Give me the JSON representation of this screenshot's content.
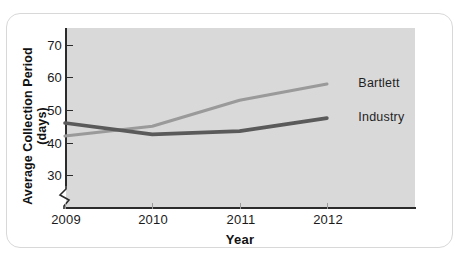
{
  "chart_data": {
    "type": "line",
    "title": "",
    "subtitle": "",
    "xlabel": "Year",
    "ylabel": "Average Collection Period (days)",
    "x": [
      2009,
      2010,
      2011,
      2012
    ],
    "categories": [
      "2009",
      "2010",
      "2011",
      "2012"
    ],
    "xtick_labels": [
      "2009",
      "2010",
      "2011",
      "2012"
    ],
    "ytick_labels": [
      "30",
      "40",
      "50",
      "60",
      "70"
    ],
    "ytick_values": [
      30,
      40,
      50,
      60,
      70
    ],
    "ylim": [
      26,
      73
    ],
    "xlim": [
      2009,
      2012.9
    ],
    "y_axis_broken": true,
    "grid": false,
    "legend_position": "inline-right",
    "plot_background": "#d9d9d9",
    "series": [
      {
        "name": "Bartlett",
        "label": "Bartlett",
        "color": "#9a9a9a",
        "values": [
          42,
          45,
          53,
          58
        ]
      },
      {
        "name": "Industry",
        "label": "Industry",
        "color": "#5a5a5a",
        "values": [
          46,
          42.5,
          43.5,
          47.5
        ]
      }
    ],
    "annotations": [
      {
        "text": "Bartlett",
        "x": 2012.2,
        "y": 58
      },
      {
        "text": "Industry",
        "x": 2012.2,
        "y": 47.5
      }
    ]
  },
  "axis": {
    "y_title": "Average Collection Period (days)",
    "x_title": "Year",
    "y_ticks": [
      {
        "label": "70",
        "value": 70
      },
      {
        "label": "60",
        "value": 60
      },
      {
        "label": "50",
        "value": 50
      },
      {
        "label": "40",
        "value": 40
      },
      {
        "label": "30",
        "value": 30
      }
    ],
    "x_ticks": [
      {
        "label": "2009",
        "value": 2009
      },
      {
        "label": "2010",
        "value": 2010
      },
      {
        "label": "2011",
        "value": 2011
      },
      {
        "label": "2012",
        "value": 2012
      }
    ]
  },
  "labels": {
    "bartlett": "Bartlett",
    "industry": "Industry"
  },
  "colors": {
    "plot_bg": "#d9d9d9",
    "axis": "#2b2b2b",
    "bartlett_line": "#9a9a9a",
    "industry_line": "#5a5a5a",
    "card_border": "#d8d8d8"
  }
}
